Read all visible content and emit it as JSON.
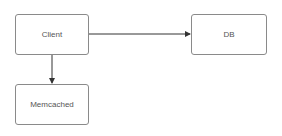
{
  "diagram": {
    "nodes": [
      {
        "id": "client",
        "label": "Client",
        "x": 15,
        "y": 14,
        "w": 74,
        "h": 41
      },
      {
        "id": "db",
        "label": "DB",
        "x": 191,
        "y": 14,
        "w": 76,
        "h": 41
      },
      {
        "id": "memcached",
        "label": "Memcached",
        "x": 15,
        "y": 84,
        "w": 74,
        "h": 41
      }
    ],
    "edges": [
      {
        "from": "client",
        "to": "db",
        "direction": "right"
      },
      {
        "from": "client",
        "to": "memcached",
        "direction": "down"
      }
    ],
    "colors": {
      "border": "#8a8a8a",
      "edge": "#333333",
      "text": "#555555"
    }
  }
}
